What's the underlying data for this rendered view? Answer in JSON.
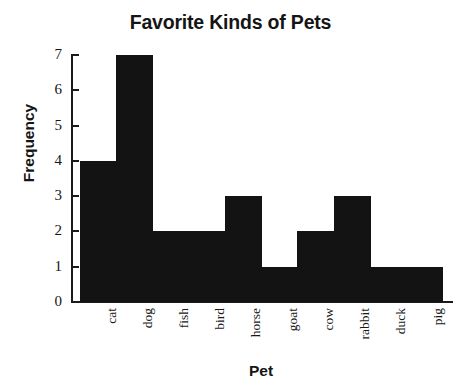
{
  "chart_data": {
    "type": "bar",
    "title": "Favorite Kinds of Pets",
    "xlabel": "Pet",
    "ylabel": "Frequency",
    "categories": [
      "cat",
      "dog",
      "fish",
      "bird",
      "horse",
      "goat",
      "cow",
      "rabbit",
      "duck",
      "pig"
    ],
    "values": [
      4,
      7,
      2,
      2,
      3,
      1,
      2,
      3,
      1,
      1
    ],
    "ylim": [
      0,
      7
    ],
    "yticks": [
      0,
      1,
      2,
      3,
      4,
      5,
      6,
      7
    ],
    "ytick_labels": [
      "0",
      "1",
      "2",
      "3",
      "4",
      "5",
      "6",
      "7"
    ],
    "grid": false,
    "legend": false,
    "bar_color": "#131313",
    "axis_color": "#1b1b1b",
    "background": "#ffffff"
  }
}
